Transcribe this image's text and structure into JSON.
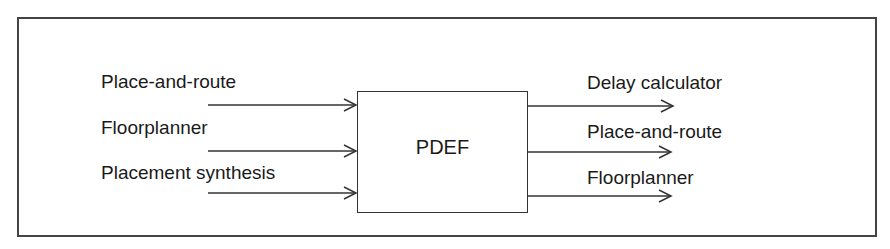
{
  "diagram": {
    "center_block": {
      "label": "PDEF"
    },
    "inputs": [
      {
        "label": "Place-and-route",
        "arrow_y": 105
      },
      {
        "label": "Floorplanner",
        "arrow_y": 151
      },
      {
        "label": "Placement synthesis",
        "arrow_y": 193
      }
    ],
    "outputs": [
      {
        "label": "Delay calculator",
        "arrow_y": 106
      },
      {
        "label": "Place-and-route",
        "arrow_y": 152
      },
      {
        "label": "Floorplanner",
        "arrow_y": 196
      }
    ]
  }
}
